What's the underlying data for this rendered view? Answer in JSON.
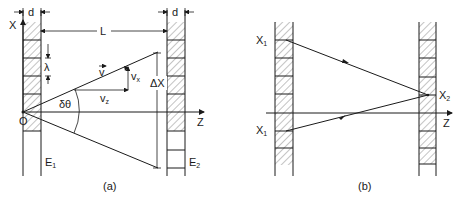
{
  "figure": {
    "panel_a": {
      "caption": "(a)",
      "labels": {
        "d_left": "d",
        "d_right": "d",
        "L": "L",
        "x_axis": "X",
        "z_axis": "Z",
        "origin": "O",
        "lambda": "λ",
        "v": "v",
        "vx": "v",
        "vx_sub": "x",
        "vz": "v",
        "vz_sub": "z",
        "delta_theta": "δθ",
        "delta_x": "ΔX",
        "E1": "E",
        "E1_sub": "1",
        "E2": "E",
        "E2_sub": "2"
      }
    },
    "panel_b": {
      "caption": "(b)",
      "labels": {
        "x1_top": "X",
        "x1_top_sub": "1",
        "x1_bottom": "X",
        "x1_bottom_sub": "1",
        "x2": "X",
        "x2_sub": "2",
        "z_axis": "Z"
      }
    },
    "colors": {
      "ink": "#1a1a1a",
      "background": "#ffffff"
    }
  }
}
